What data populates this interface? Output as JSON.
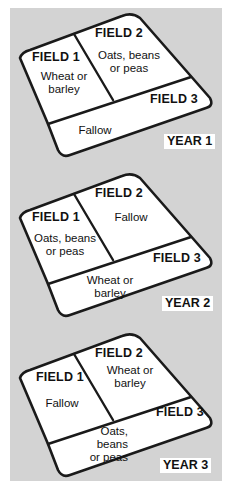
{
  "colors": {
    "background": "#d3d3d3",
    "field_fill": "#ffffff",
    "outline": "#1a1a1a"
  },
  "diagrams": [
    {
      "year_label": "YEAR 1",
      "fields": [
        {
          "name": "FIELD 1",
          "crop": "Wheat or\nbarley"
        },
        {
          "name": "FIELD 2",
          "crop": "Oats, beans\nor peas"
        },
        {
          "name": "FIELD 3",
          "crop": "Fallow"
        }
      ]
    },
    {
      "year_label": "YEAR 2",
      "fields": [
        {
          "name": "FIELD 1",
          "crop": "Oats, beans\nor peas"
        },
        {
          "name": "FIELD 2",
          "crop": "Fallow"
        },
        {
          "name": "FIELD 3",
          "crop": "Wheat or\nbarley"
        }
      ]
    },
    {
      "year_label": "YEAR 3",
      "fields": [
        {
          "name": "FIELD 1",
          "crop": "Fallow"
        },
        {
          "name": "FIELD 2",
          "crop": "Wheat or\nbarley"
        },
        {
          "name": "FIELD 3",
          "crop": "Oats,\nbeans\nor peas"
        }
      ]
    }
  ]
}
